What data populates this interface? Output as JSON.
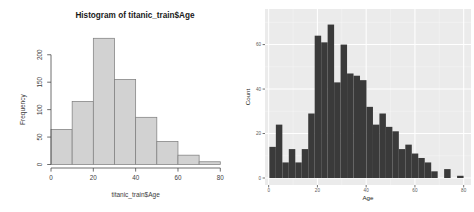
{
  "page": {
    "background": "#ffffff",
    "description": "Two side-by-side histograms of Titanic training-set passenger ages"
  },
  "chart_data": [
    {
      "id": "base_r_age_histogram",
      "type": "bar",
      "library_style": "base-r",
      "title": "Histogram of titanic_train$Age",
      "xlabel": "titanic_train$Age",
      "ylabel": "Frequency",
      "bin_edges": [
        0,
        10,
        20,
        30,
        40,
        50,
        60,
        70,
        80
      ],
      "values": [
        64,
        115,
        230,
        155,
        86,
        42,
        17,
        5
      ],
      "xticks": [
        0,
        20,
        40,
        60,
        80
      ],
      "yticks": [
        0,
        50,
        100,
        150,
        200
      ],
      "xlim": [
        0,
        80
      ],
      "ylim": [
        0,
        230
      ],
      "grid": false,
      "legend": "none",
      "bar_fill": "#d2d2d2",
      "bar_stroke": "#808080",
      "axis_color": "#4a4a4a",
      "text_color": "#3d3d3d",
      "title_color": "#1a1a1a"
    },
    {
      "id": "ggplot_age_histogram",
      "type": "bar",
      "library_style": "ggplot",
      "title": "",
      "xlabel": "Age",
      "ylabel": "Count",
      "bin_start": 0.3,
      "bin_width": 2.655,
      "values": [
        14,
        24,
        7,
        13,
        7,
        13,
        29,
        64,
        61,
        69,
        43,
        60,
        47,
        46,
        44,
        32,
        24,
        29,
        23,
        21,
        13,
        15,
        11,
        9,
        7,
        3,
        0,
        4,
        0,
        1
      ],
      "xticks": [
        0,
        20,
        40,
        60,
        80
      ],
      "yticks": [
        0,
        20,
        40,
        60
      ],
      "minor_xticks": [
        10,
        30,
        50,
        70
      ],
      "minor_yticks": [
        10,
        30,
        50,
        70
      ],
      "xlim": [
        -1.5,
        83
      ],
      "ylim": [
        0,
        76
      ],
      "grid": true,
      "legend": "none",
      "panel_bg": "#ebebeb",
      "grid_major_color": "#ffffff",
      "grid_minor_color": "#ffffff",
      "bar_fill": "#3a3a3a",
      "tick_color": "#333333",
      "tick_label_color": "#5a5a5a",
      "axis_title_color": "#1a1a1a"
    }
  ]
}
